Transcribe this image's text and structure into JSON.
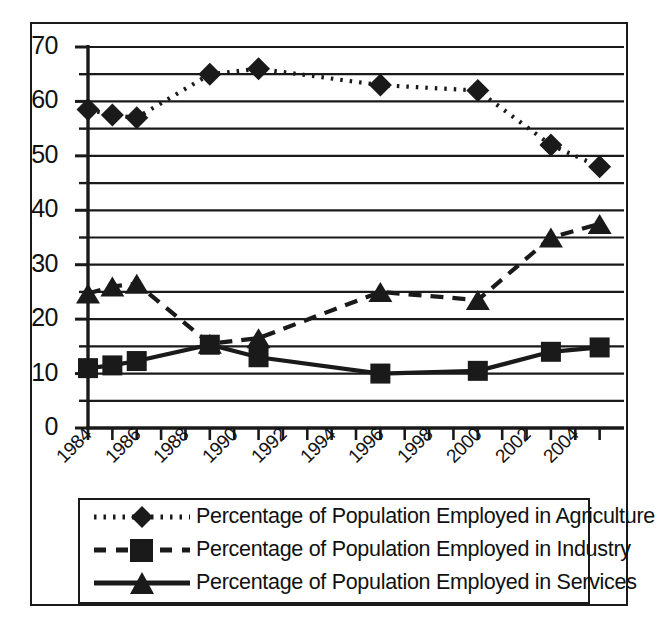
{
  "figure": {
    "background_color": "#ffffff",
    "line_color": "#1a1a1a",
    "frame": true
  },
  "chart_data": {
    "type": "line",
    "title": "",
    "subtitle": "",
    "xlabel": "",
    "ylabel": "",
    "xlim": [
      1983.5,
      2005.5
    ],
    "ylim": [
      0,
      70
    ],
    "grid": true,
    "grid_interval": 5,
    "legend_position": "bottom",
    "y_ticks": [
      0,
      10,
      20,
      30,
      40,
      50,
      60,
      70
    ],
    "y_tick_labels": [
      "0",
      "10",
      "20",
      "30",
      "40",
      "50",
      "60",
      "70"
    ],
    "y_minor_ticks": [
      5,
      15,
      25,
      35,
      45,
      55,
      65
    ],
    "x_ticks": [
      1984,
      1985,
      1986,
      1987,
      1988,
      1989,
      1990,
      1991,
      1992,
      1993,
      1994,
      1995,
      1996,
      1997,
      1998,
      1999,
      2000,
      2001,
      2002,
      2003,
      2004,
      2005
    ],
    "x_tick_labels": [
      "1984",
      "1986",
      "1988",
      "1990",
      "1992",
      "1994",
      "1996",
      "1998",
      "2000",
      "2002",
      "2004"
    ],
    "x_labelled_years": [
      1984,
      1986,
      1988,
      1990,
      1992,
      1994,
      1996,
      1998,
      2000,
      2002,
      2004
    ],
    "series": [
      {
        "name": "Percentage of Population Employed in Agriculture",
        "marker": "diamond",
        "linestyle": "dotted",
        "color": "#1a1a1a",
        "x": [
          1984,
          1985,
          1986,
          1989,
          1991,
          1996,
          2000,
          2003,
          2005
        ],
        "values": [
          58.5,
          57.5,
          57.0,
          65.0,
          66.0,
          63.0,
          62.0,
          52.0,
          48.0
        ]
      },
      {
        "name": "Percentage of Population Employed in Industry",
        "marker": "square",
        "linestyle": "solid",
        "color": "#1a1a1a",
        "x": [
          1984,
          1985,
          1986,
          1989,
          1991,
          1996,
          2000,
          2003,
          2005
        ],
        "values": [
          11.0,
          11.5,
          12.3,
          15.3,
          13.0,
          10.0,
          10.5,
          14.0,
          14.8
        ]
      },
      {
        "name": "Percentage of Population Employed in Services",
        "marker": "triangle",
        "linestyle": "dashed",
        "color": "#1a1a1a",
        "x": [
          1984,
          1985,
          1986,
          1989,
          1991,
          1996,
          2000,
          2003,
          2005
        ],
        "values": [
          24.7,
          26.0,
          26.5,
          15.5,
          16.5,
          25.0,
          23.5,
          35.0,
          37.5
        ]
      }
    ]
  },
  "legend": {
    "entries": [
      {
        "label": "Percentage of Population Employed in Agriculture",
        "marker": "diamond",
        "linestyle": "dotted"
      },
      {
        "label": "Percentage of Population Employed in Industry",
        "marker": "square",
        "linestyle": "dashed"
      },
      {
        "label": "Percentage of Population Employed in Services",
        "marker": "triangle",
        "linestyle": "solid"
      }
    ]
  }
}
